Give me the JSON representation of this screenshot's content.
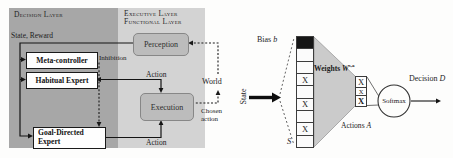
{
  "figure": {
    "left_panel": {
      "decision_layer_title": "Decision Layer",
      "executive_layer_title": "Executive Layer",
      "functional_layer_title": "Functional Layer",
      "state_reward_label": "State, Reward",
      "meta_controller_label": "Meta-controller",
      "habitual_expert_label": "Habitual Expert",
      "goal_directed_line1": "Goal-Directed",
      "goal_directed_line2": "Expert",
      "inhibition_label": "Inhibition",
      "action_top_label": "Action",
      "action_bottom_label": "Action",
      "perception_label": "Perception",
      "execution_label": "Execution",
      "world_label": "World",
      "chosen_action_line1": "Chosen",
      "chosen_action_line2": "action",
      "colors": {
        "decision_panel": "#a7a7a7",
        "functional_panel": "#d3d3d3",
        "process_box_fill": "#bcbcbc",
        "process_box_border": "#878787"
      }
    },
    "right_panel": {
      "state_label": "State",
      "bias_label": "Bias",
      "bias_var": "b",
      "state_vector_var": "S",
      "weights_label": "Weights",
      "weights_var": "W",
      "weights_sup": "s,a",
      "actions_label": "Actions",
      "actions_var": "A",
      "softmax_label": "Softmax",
      "decision_label": "Decision",
      "decision_var": "D",
      "cell_mark": "X",
      "state_vector_cells": [
        "bias",
        "empty",
        "empty",
        "x",
        "empty",
        "x",
        "empty",
        "x",
        "empty"
      ],
      "action_vector_cells": [
        "x",
        "x-small",
        "x-bold"
      ],
      "colors": {
        "weights_triangle_fill": "#cbcbcb",
        "bias_cell_fill": "#161616"
      }
    }
  }
}
